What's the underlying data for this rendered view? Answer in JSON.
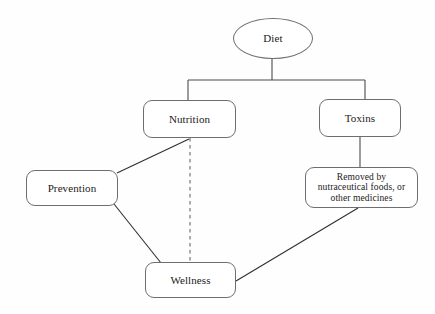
{
  "diagram": {
    "type": "flowchart",
    "background_color": "#fefefe",
    "stroke_color": "#4a4a4f",
    "text_color": "#1a1a1a",
    "nodes": [
      {
        "id": "diet",
        "label": "Diet",
        "shape": "ellipse"
      },
      {
        "id": "nutrition",
        "label": "Nutrition",
        "shape": "rounded-rect"
      },
      {
        "id": "toxins",
        "label": "Toxins",
        "shape": "rounded-rect"
      },
      {
        "id": "removed",
        "label": "Removed by nutraceutical foods, or other medicines",
        "shape": "rounded-rect",
        "lines": [
          "Removed by",
          "nutraceutical foods, or",
          "other medicines"
        ]
      },
      {
        "id": "prevention",
        "label": "Prevention",
        "shape": "rounded-rect"
      },
      {
        "id": "wellness",
        "label": "Wellness",
        "shape": "rounded-rect"
      }
    ],
    "edges": [
      {
        "from": "diet",
        "to": "nutrition",
        "style": "solid",
        "routing": "orthogonal"
      },
      {
        "from": "diet",
        "to": "toxins",
        "style": "solid",
        "routing": "orthogonal"
      },
      {
        "from": "toxins",
        "to": "removed",
        "style": "solid",
        "routing": "straight"
      },
      {
        "from": "prevention",
        "to": "nutrition",
        "style": "solid",
        "routing": "straight"
      },
      {
        "from": "prevention",
        "to": "wellness",
        "style": "solid",
        "routing": "straight"
      },
      {
        "from": "nutrition",
        "to": "wellness",
        "style": "dashed",
        "routing": "straight"
      },
      {
        "from": "removed",
        "to": "wellness",
        "style": "solid",
        "routing": "straight"
      }
    ]
  }
}
